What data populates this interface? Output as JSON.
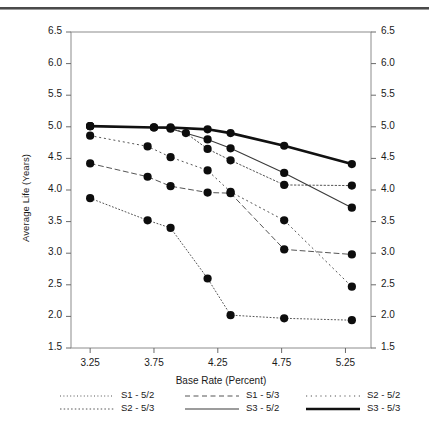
{
  "chart_data": {
    "type": "line",
    "title": "",
    "xlabel": "Base Rate (Percent)",
    "ylabel": "Average Life (Years)",
    "x": [
      3.25,
      3.5,
      3.75,
      4.0,
      4.1,
      4.25,
      4.35,
      4.75,
      5.3
    ],
    "xlim": [
      3.1,
      5.45
    ],
    "ylim": [
      1.5,
      6.5
    ],
    "xticks": [
      "3.25",
      "3.75",
      "4.25",
      "4.75",
      "5.25"
    ],
    "xtick_values": [
      3.25,
      3.75,
      4.25,
      4.75,
      5.25
    ],
    "yticks": [
      "1.5",
      "2.0",
      "2.5",
      "3.0",
      "3.5",
      "4.0",
      "4.5",
      "5.0",
      "5.5",
      "6.0",
      "6.5"
    ],
    "ytick_values": [
      1.5,
      2.0,
      2.5,
      3.0,
      3.5,
      4.0,
      4.5,
      5.0,
      5.5,
      6.0,
      6.5
    ],
    "grid": false,
    "legend_position": "below",
    "right_axis_mirrored": true,
    "marker": "filled-circle",
    "series": [
      {
        "name": "S1 - 5/2",
        "style": "dotted-fine",
        "color": "#555555",
        "width": 1.0,
        "points": [
          [
            3.25,
            3.87
          ],
          [
            3.7,
            3.52
          ],
          [
            3.88,
            3.4
          ],
          [
            4.17,
            2.6
          ],
          [
            4.35,
            2.02
          ],
          [
            4.77,
            1.97
          ],
          [
            5.3,
            1.94
          ]
        ]
      },
      {
        "name": "S1 - 5/3",
        "style": "dashed",
        "color": "#555555",
        "width": 1.0,
        "points": [
          [
            3.25,
            4.42
          ],
          [
            3.7,
            4.21
          ],
          [
            3.88,
            4.06
          ],
          [
            4.17,
            3.96
          ],
          [
            4.35,
            3.95
          ],
          [
            4.77,
            3.06
          ],
          [
            5.3,
            2.98
          ]
        ]
      },
      {
        "name": "S2 - 5/2",
        "style": "dotted-sparse",
        "color": "#555555",
        "width": 1.0,
        "points": [
          [
            3.25,
            4.86
          ],
          [
            3.7,
            4.69
          ],
          [
            3.88,
            4.52
          ],
          [
            4.17,
            4.31
          ],
          [
            4.35,
            3.97
          ],
          [
            4.77,
            3.52
          ],
          [
            5.3,
            2.47
          ]
        ]
      },
      {
        "name": "S2 - 5/3",
        "style": "dash-dot",
        "color": "#555555",
        "width": 1.0,
        "points": [
          [
            3.25,
            5.01
          ],
          [
            3.88,
            4.98
          ],
          [
            4.0,
            4.9
          ],
          [
            4.17,
            4.65
          ],
          [
            4.35,
            4.47
          ],
          [
            4.77,
            4.08
          ],
          [
            5.3,
            4.07
          ]
        ]
      },
      {
        "name": "S3 - 5/2",
        "style": "solid-thin",
        "color": "#3a3a3a",
        "width": 1.1,
        "points": [
          [
            3.25,
            5.01
          ],
          [
            3.75,
            4.99
          ],
          [
            3.88,
            4.97
          ],
          [
            4.17,
            4.8
          ],
          [
            4.35,
            4.66
          ],
          [
            4.77,
            4.27
          ],
          [
            5.3,
            3.72
          ]
        ]
      },
      {
        "name": "S3 - 5/3",
        "style": "solid-thick",
        "color": "#111111",
        "width": 2.6,
        "points": [
          [
            3.25,
            5.01
          ],
          [
            3.75,
            4.99
          ],
          [
            3.88,
            4.99
          ],
          [
            4.17,
            4.96
          ],
          [
            4.35,
            4.9
          ],
          [
            4.77,
            4.7
          ],
          [
            5.3,
            4.41
          ]
        ]
      }
    ],
    "legend": [
      {
        "label": "S1 - 5/2",
        "style": "dotted-fine"
      },
      {
        "label": "S1 - 5/3",
        "style": "dashed"
      },
      {
        "label": "S2 - 5/2",
        "style": "dotted-sparse"
      },
      {
        "label": "S2 - 5/3",
        "style": "dash-dot"
      },
      {
        "label": "S3 - 5/2",
        "style": "solid-thin"
      },
      {
        "label": "S3 - 5/3",
        "style": "solid-thick"
      }
    ]
  }
}
